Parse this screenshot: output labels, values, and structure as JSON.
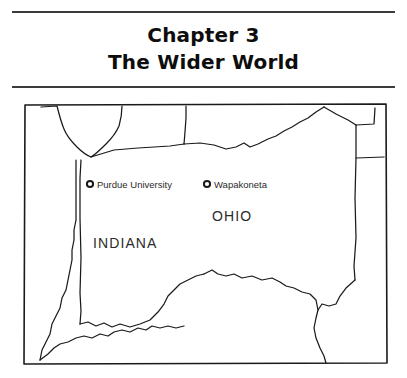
{
  "heading": {
    "line1": "Chapter 3",
    "line2": "The Wider World"
  },
  "map": {
    "cities": [
      {
        "name": "Purdue University",
        "marker": "open-circle"
      },
      {
        "name": "Wapakoneta",
        "marker": "open-circle"
      }
    ],
    "states": [
      {
        "name": "INDIANA"
      },
      {
        "name": "OHIO"
      }
    ],
    "colors": {
      "ink": "#1a1a1a",
      "label": "#2b2b2b",
      "rule": "#3b3b3b",
      "background": "#ffffff"
    }
  }
}
